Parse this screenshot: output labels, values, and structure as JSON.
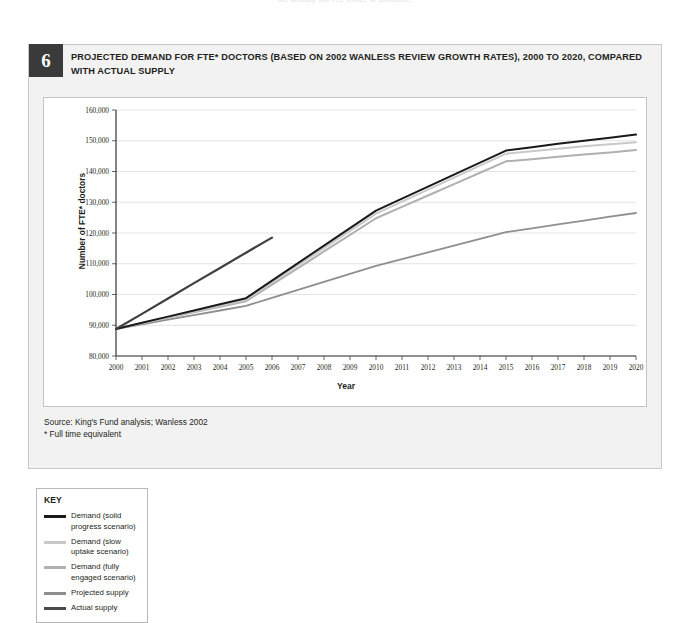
{
  "page": {
    "top_cut_text": "are actually still free choice of candidate."
  },
  "figure": {
    "number": "6",
    "title": "PROJECTED DEMAND FOR FTE* DOCTORS (BASED ON 2002 WANLESS REVIEW GROWTH RATES), 2000 TO 2020, COMPARED WITH ACTUAL SUPPLY",
    "source": "Source: King's Fund analysis; Wanless 2002",
    "footnote": "* Full time equivalent"
  },
  "key": {
    "title": "KEY",
    "items": [
      {
        "label": "Demand (solid progress scenario)",
        "color": "#1a1a1a"
      },
      {
        "label": "Demand (slow uptake scenario)",
        "color": "#c9c9c9"
      },
      {
        "label": "Demand (fully engaged scenario)",
        "color": "#b0b0b0"
      },
      {
        "label": "Projected supply",
        "color": "#8f8f8f"
      },
      {
        "label": "Actual supply",
        "color": "#4a4a4a"
      }
    ]
  },
  "chart_data": {
    "type": "line",
    "title": "PROJECTED DEMAND FOR FTE* DOCTORS (BASED ON 2002 WANLESS REVIEW GROWTH RATES), 2000 TO 2020, COMPARED WITH ACTUAL SUPPLY",
    "xlabel": "Year",
    "ylabel": "Number of FTE* doctors",
    "ylim": [
      80000,
      160000
    ],
    "yticks": [
      80000,
      90000,
      100000,
      110000,
      120000,
      130000,
      140000,
      150000,
      160000
    ],
    "ytick_labels": [
      "80,000",
      "90,000",
      "100,000",
      "110,000",
      "120,000",
      "130,000",
      "140,000",
      "150,000",
      "160,000"
    ],
    "x": [
      2000,
      2001,
      2002,
      2003,
      2004,
      2005,
      2006,
      2007,
      2008,
      2009,
      2010,
      2011,
      2012,
      2013,
      2014,
      2015,
      2016,
      2017,
      2018,
      2019,
      2020
    ],
    "xtick_labels": [
      "2000",
      "2001",
      "2002",
      "2003",
      "2004",
      "2005",
      "2006",
      "2007",
      "2008",
      "2009",
      "2010",
      "2011",
      "2012",
      "2013",
      "2014",
      "2015",
      "2016",
      "2017",
      "2018",
      "2019",
      "2020"
    ],
    "grid": true,
    "legend_position": "below-left-box",
    "series": [
      {
        "name": "Demand (solid progress scenario)",
        "color": "#1a1a1a",
        "width": 2.0,
        "values": [
          88800,
          90800,
          92800,
          94800,
          96800,
          98800,
          104500,
          110200,
          115900,
          121600,
          127300,
          131200,
          135100,
          139000,
          142900,
          146800,
          147900,
          149000,
          150000,
          151000,
          152000
        ]
      },
      {
        "name": "Demand (slow uptake scenario)",
        "color": "#c9c9c9",
        "width": 2.0,
        "values": [
          88800,
          90700,
          92600,
          94500,
          96400,
          98300,
          103900,
          109500,
          115100,
          120700,
          126300,
          130200,
          134100,
          138000,
          141900,
          145800,
          146600,
          147400,
          148200,
          148900,
          149500
        ]
      },
      {
        "name": "Demand (fully engaged scenario)",
        "color": "#b0b0b0",
        "width": 2.0,
        "values": [
          88800,
          90600,
          92400,
          94200,
          96000,
          97800,
          103200,
          108600,
          114000,
          119400,
          124800,
          128500,
          132200,
          135900,
          139600,
          143300,
          144000,
          144800,
          145500,
          146200,
          147000
        ]
      },
      {
        "name": "Projected supply",
        "color": "#8f8f8f",
        "width": 1.8,
        "values": [
          88800,
          90300,
          91800,
          93300,
          94800,
          96300,
          98900,
          101500,
          104100,
          106700,
          109300,
          111500,
          113700,
          115900,
          118100,
          120300,
          121500,
          122800,
          124000,
          125300,
          126500
        ]
      },
      {
        "name": "Actual supply",
        "color": "#3f3f3f",
        "width": 2.2,
        "values": [
          88800,
          93700,
          98700,
          103700,
          108600,
          113600,
          118500,
          null,
          null,
          null,
          null,
          null,
          null,
          null,
          null,
          null,
          null,
          null,
          null,
          null,
          null
        ]
      }
    ]
  }
}
